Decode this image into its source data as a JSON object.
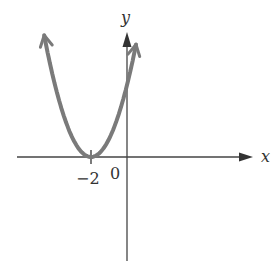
{
  "chart_data": {
    "type": "line",
    "title": "",
    "function": "y = (x + 2)^2",
    "xlabel": "x",
    "ylabel": "y",
    "x_tick_labels": [
      "-2",
      "0"
    ],
    "vertex": {
      "x": -2,
      "y": 0
    },
    "series": [
      {
        "name": "parabola",
        "color": "#7a7a7a",
        "x": [
          -4.6,
          -4,
          -3.5,
          -3,
          -2.5,
          -2,
          -1.5,
          -1,
          -0.5,
          0,
          0.5
        ],
        "y": [
          6.76,
          4,
          2.25,
          1,
          0.25,
          0,
          0.25,
          1,
          2.25,
          4,
          6.25
        ]
      }
    ],
    "xlim": [
      -6,
      7
    ],
    "ylim": [
      -5.7,
      7
    ],
    "grid": false,
    "legend": null
  },
  "axes": {
    "x_label": "x",
    "y_label": "y",
    "origin_label": "0",
    "tick_label": "−2"
  },
  "colors": {
    "axis": "#333333",
    "curve": "#7a7a7a"
  }
}
